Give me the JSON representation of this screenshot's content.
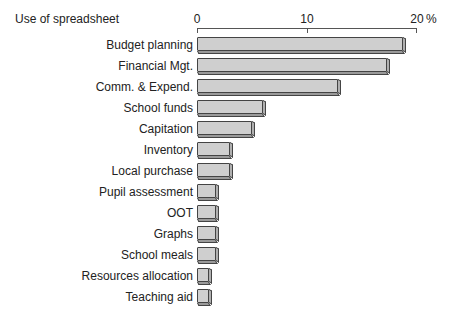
{
  "chart_data": {
    "type": "bar",
    "orientation": "horizontal",
    "title": "Use of spreadsheet",
    "xlabel": "%",
    "ylabel": "",
    "xlim": [
      0,
      20
    ],
    "x_ticks": [
      "0",
      "10",
      "20"
    ],
    "unit_label": "%",
    "grid": false,
    "legend": null,
    "categories": [
      "Budget planning",
      "Financial Mgt.",
      "Comm. & Expend.",
      "School funds",
      "Capitation",
      "Inventory",
      "Local purchase",
      "Pupil assessment",
      "OOT",
      "Graphs",
      "School meals",
      "Resources allocation",
      "Teaching aid"
    ],
    "values": [
      18.7,
      17.3,
      12.8,
      6.0,
      5.0,
      3.0,
      3.0,
      1.7,
      1.7,
      1.7,
      1.7,
      1.1,
      1.1
    ]
  },
  "colors": {
    "bar_fill": "#cfcfcf",
    "bar_outline": "#444444"
  }
}
